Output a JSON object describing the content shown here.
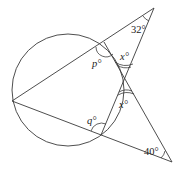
{
  "diagram": {
    "type": "geometry",
    "labels": {
      "p": "p°",
      "q": "q°",
      "x_top": "x°",
      "x_bottom": "x°",
      "angle_top_apex": "32°",
      "angle_bottom_apex": "40°"
    },
    "given_angles": {
      "top_apex_deg": 32,
      "bottom_apex_deg": 40
    },
    "unknowns": [
      "p",
      "q",
      "x"
    ]
  }
}
